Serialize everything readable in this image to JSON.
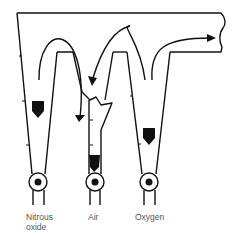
{
  "diagram": {
    "colors": {
      "stroke": "#111111",
      "label": "#555555",
      "background": "#ffffff"
    },
    "flowmeters": [
      {
        "id": "nitrous",
        "label_line1": "Nitrous",
        "label_line2": "oxide",
        "bobbin": "float-icon"
      },
      {
        "id": "air",
        "label_line1": "Air",
        "label_line2": "",
        "bobbin": "float-icon",
        "cracked": true
      },
      {
        "id": "oxygen",
        "label_line1": "Oxygen",
        "label_line2": "",
        "bobbin": "float-icon"
      }
    ],
    "arrows": [
      {
        "name": "flow-arrow-nitrous-into-air",
        "direction": "down"
      },
      {
        "name": "flow-arrow-back-into-crack",
        "direction": "down-left"
      },
      {
        "name": "flow-arrow-oxygen-to-outlet",
        "direction": "right"
      }
    ]
  }
}
